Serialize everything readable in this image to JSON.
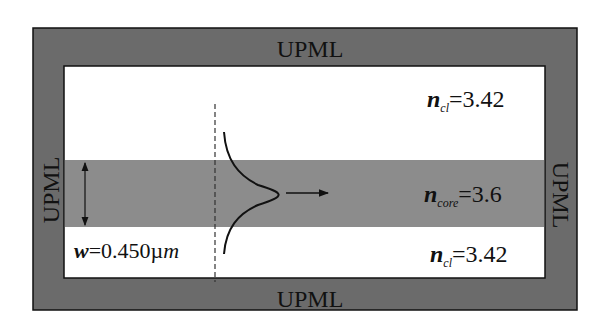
{
  "diagram": {
    "colors": {
      "upml": "#6b6b6b",
      "core": "#8c8c8c",
      "cladding": "#ffffff",
      "stroke": "#111111"
    },
    "boundaries": {
      "top": "UPML",
      "bottom": "UPML",
      "left": "UPML",
      "right": "UPML"
    },
    "regions": {
      "upper_cladding": {
        "symbol": "n",
        "subscript": "cl",
        "value": "=3.42"
      },
      "core": {
        "symbol": "n",
        "subscript": "core",
        "value": "=3.6"
      },
      "lower_cladding": {
        "symbol": "n",
        "subscript": "cl",
        "value": "=3.42"
      }
    },
    "width_label": {
      "symbol": "w",
      "value": "=0.450µ",
      "unit": "m"
    },
    "elements": {
      "source_line": "dashed vertical source plane",
      "mode_profile": "gaussian mode profile",
      "propagation_arrow": "propagation direction arrow",
      "width_arrow": "double-headed core width arrow"
    }
  }
}
